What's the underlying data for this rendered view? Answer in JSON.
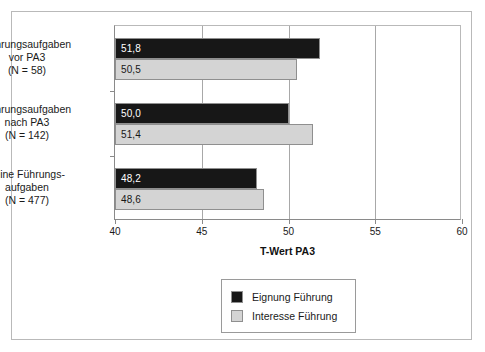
{
  "chart_data": {
    "type": "bar",
    "orientation": "horizontal",
    "title": "",
    "xlabel": "T-Wert PA3",
    "ylabel": "",
    "xlim": [
      40,
      60
    ],
    "xticks": [
      40,
      45,
      50,
      55,
      60
    ],
    "xticklabels": [
      "40",
      "45",
      "50",
      "55",
      "60"
    ],
    "grid": true,
    "grid_axis": "x",
    "legend_position": "below-center",
    "categories": [
      "Führungsaufgaben vor PA3 (N = 58)",
      "Führungsaufgaben nach PA3 (N = 142)",
      "keine Führungsaufgaben (N = 477)"
    ],
    "category_label_lines": [
      [
        "Führungsaufgaben",
        "vor PA3",
        "(N = 58)"
      ],
      [
        "Führungsaufgaben",
        "nach PA3",
        "(N = 142)"
      ],
      [
        "keine Führungs-",
        "aufgaben",
        "(N = 477)"
      ]
    ],
    "series": [
      {
        "name": "Eignung Führung",
        "color": "#171717",
        "values": [
          51.8,
          50.0,
          48.2
        ],
        "value_labels": [
          "51,8",
          "50,0",
          "48,2"
        ]
      },
      {
        "name": "Interesse Führung",
        "color": "#d4d4d4",
        "values": [
          50.5,
          51.4,
          48.6
        ],
        "value_labels": [
          "50,5",
          "51,4",
          "48,6"
        ]
      }
    ]
  },
  "legend": {
    "items": [
      {
        "label": "Eignung Führung",
        "swatch": "dark"
      },
      {
        "label": "Interesse Führung",
        "swatch": "light"
      }
    ]
  },
  "colors": {
    "dark_bar": "#171717",
    "light_bar": "#d4d4d4",
    "frame": "#b9b9b9",
    "axis": "#8a8a8a",
    "gridline": "#a8a8a8",
    "background": "#ffffff"
  }
}
